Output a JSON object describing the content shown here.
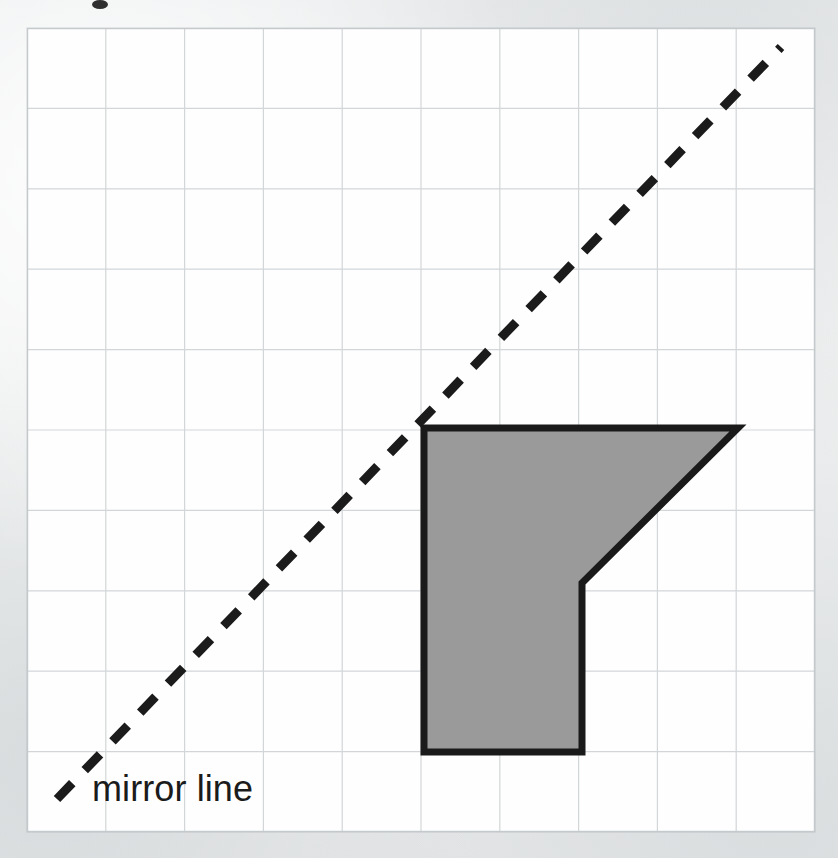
{
  "page": {
    "width": 838,
    "height": 858,
    "background_color": "#edeeef",
    "paper_color": "#fefefe"
  },
  "grid": {
    "name": "square-grid",
    "left": 27,
    "top": 28,
    "width": 788,
    "height": 804,
    "columns": 10,
    "rows": 10,
    "cell_width": 78.8,
    "cell_height": 80.4,
    "line_color": "#d2d6d8",
    "border_color": "#c4c9cb"
  },
  "mirror_line": {
    "label": "mirror line",
    "style": "dashed",
    "color": "#1b1b1b",
    "stroke_width": 9,
    "dash_pattern": "22 18",
    "x1": 57,
    "y1": 799,
    "x2": 781,
    "y2": 47,
    "slope_description": "45 degree diagonal rising left to right"
  },
  "shape": {
    "name": "shaded-polygon",
    "fill_color": "#9a9a9a",
    "stroke_color": "#1a1a1a",
    "stroke_width": 7,
    "vertices": [
      {
        "x": 424,
        "y": 428
      },
      {
        "x": 738,
        "y": 428
      },
      {
        "x": 582,
        "y": 583
      },
      {
        "x": 582,
        "y": 752
      },
      {
        "x": 424,
        "y": 752
      }
    ],
    "vertex_count": 5,
    "grid_vertices": [
      {
        "col": 5,
        "row": 5
      },
      {
        "col": 9,
        "row": 5
      },
      {
        "col": 7,
        "row": 7
      },
      {
        "col": 7,
        "row": 9
      },
      {
        "col": 5,
        "row": 9
      }
    ]
  },
  "marks": {
    "top_speck": "ink-speck"
  }
}
